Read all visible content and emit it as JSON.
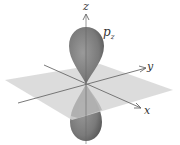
{
  "diagram": {
    "labels": {
      "z_axis": "z",
      "y_axis": "y",
      "x_axis": "x",
      "orbital_p": "p",
      "orbital_sub": "z"
    },
    "colors": {
      "lobe": "#7d7d7d",
      "lobe_dark": "#5e5e5e",
      "plane": "#d4d4d4",
      "axis": "#6a6a6a",
      "background": "#ffffff"
    }
  }
}
